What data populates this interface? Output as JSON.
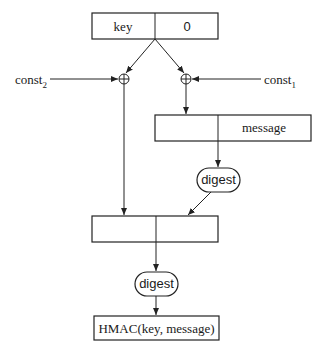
{
  "diagram": {
    "key_box": {
      "left": "key",
      "right": "0"
    },
    "const_left": {
      "base": "const",
      "sub": "2"
    },
    "const_right": {
      "base": "const",
      "sub": "1"
    },
    "xor_symbol": "⊕",
    "message_box": {
      "left": "",
      "right": "message"
    },
    "digest_inner": "digest",
    "combine_box": {
      "left": "",
      "right": ""
    },
    "digest_outer": "digest",
    "output_box": "HMAC(key, message)"
  }
}
